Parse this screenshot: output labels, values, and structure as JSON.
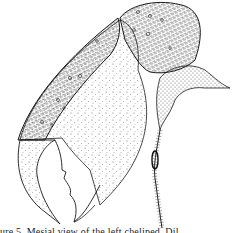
{
  "figure": {
    "parts": [
      "palm",
      "carpus",
      "fixed-finger",
      "dactyl",
      "merus-edge"
    ],
    "colors": {
      "ink": "#1a1a1a",
      "paper": "#ffffff",
      "stipple": "#555555"
    }
  },
  "caption": {
    "text": "ure 5. Mesial view of the left cheliped. Dil"
  }
}
